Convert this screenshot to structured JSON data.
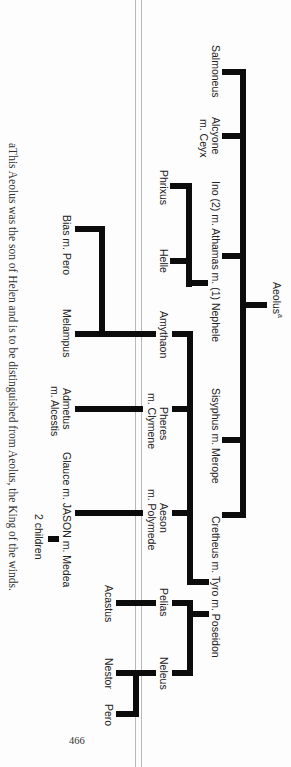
{
  "page": {
    "number": "466",
    "footnote": "aThis Aeolus was the son of Helen and is to be distinguished from Aeolus, the King of the winds."
  },
  "tree": {
    "root": {
      "name": "Aeolus",
      "superscript": "a"
    },
    "generation2": [
      {
        "line1": "Salmoneus"
      },
      {
        "line1": "Alcyone",
        "line2": "m. Ceyx"
      },
      {
        "line1": "Ino (2) m. Athamas m. (1) Nephele"
      },
      {
        "line1": "Sisyphus m. Merope"
      },
      {
        "line1": "Cretheus m. Tyro m. Poseidon"
      }
    ],
    "athamas_children": [
      {
        "line1": "Phrixus"
      },
      {
        "line1": "Helle"
      }
    ],
    "cretheus_children": [
      {
        "line1": "Amythaon"
      },
      {
        "line1": "Pheres",
        "line2": "m. Clymene"
      },
      {
        "line1": "Aeson",
        "line2": "m. Polymede"
      }
    ],
    "poseidon_children": [
      {
        "line1": "Pelias"
      },
      {
        "line1": "Neleus"
      }
    ],
    "generation4": [
      {
        "line1": "Bias m. Pero"
      },
      {
        "line1": "Melampus"
      },
      {
        "line1": "Admetus",
        "line2": "m. Alcestis"
      },
      {
        "line1": "Glauce m. JASON m. Medea"
      },
      {
        "line1": "Acastus"
      },
      {
        "line1": "Nestor"
      },
      {
        "line1": "Pero"
      }
    ],
    "generation5": [
      {
        "line1": "2 children"
      }
    ]
  }
}
